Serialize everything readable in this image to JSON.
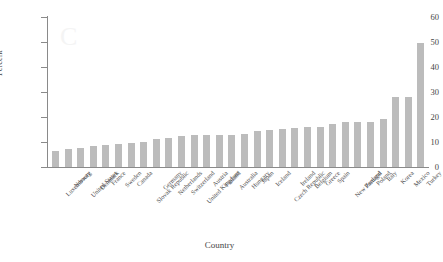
{
  "chart_data": {
    "type": "bar",
    "title": "",
    "xlabel": "Country",
    "ylabel": "Percent",
    "ylim": [
      0,
      60
    ],
    "yticks": [
      0,
      10,
      20,
      30,
      40,
      50,
      60
    ],
    "grid": false,
    "legend": "none",
    "bar_color": "#bcbcbc",
    "axis_color": "#8a8a8a",
    "categories": [
      "Luxembourg",
      "Norway",
      "United States",
      "Denmark",
      "France",
      "Sweden",
      "Canada",
      "Slovak Republic",
      "Germany",
      "Netherlands",
      "Switzerland",
      "United Kingdom",
      "Austria",
      "Finland",
      "Australia",
      "Hungary",
      "Japan",
      "Iceland",
      "Czech Republic",
      "Ireland",
      "Belgium",
      "Greece",
      "Spain",
      "New Zealand",
      "Portugal",
      "Poland",
      "Italy",
      "Korea",
      "Mexico",
      "Turkey"
    ],
    "values": [
      6.5,
      7.3,
      7.5,
      8.6,
      8.8,
      9.4,
      9.8,
      9.9,
      11.4,
      11.8,
      12.6,
      12.8,
      12.8,
      12.8,
      13.0,
      13.4,
      14.4,
      15.0,
      15.3,
      15.8,
      16.0,
      16.2,
      17.2,
      18.0,
      18.0,
      18.0,
      19.4,
      28.0,
      28.0,
      49.7
    ]
  }
}
